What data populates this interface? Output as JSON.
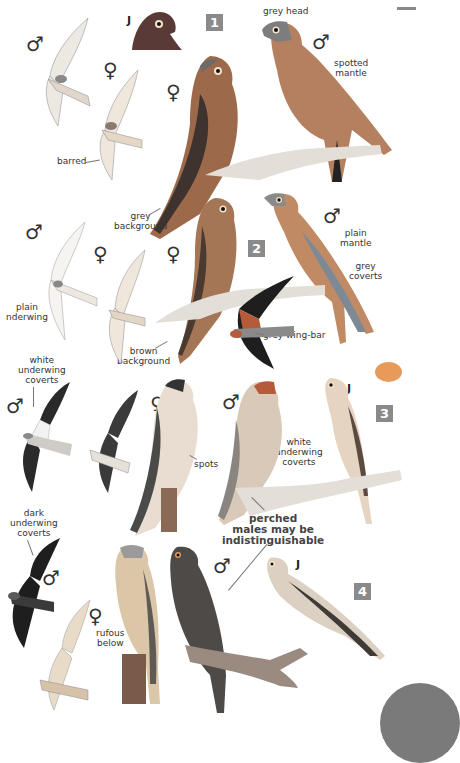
{
  "page": {
    "type": "field-guide-plate",
    "colors": {
      "badge": "#8a8a8a",
      "accent_blob": "#e89a5a",
      "corner_tab": "#7a7a7a"
    }
  },
  "sections": [
    {
      "number": "1",
      "labels": [
        "grey head",
        "spotted mantle",
        "barred",
        "grey background"
      ],
      "symbols": [
        "♂",
        "♀",
        "♀",
        "♂",
        "J"
      ]
    },
    {
      "number": "2",
      "labels": [
        "plain mantle",
        "grey coverts",
        "plain nderwing",
        "brown background",
        "grey wing-bar"
      ],
      "symbols": [
        "♂",
        "♀",
        "♀",
        "♂"
      ]
    },
    {
      "number": "3",
      "labels": [
        "white underwing coverts",
        "spots",
        "white underwing coverts",
        "perched males may be indistinguishable"
      ],
      "symbols": [
        "♂",
        "♀",
        "♂",
        "J"
      ]
    },
    {
      "number": "4",
      "labels": [
        "dark underwing coverts",
        "rufous below"
      ],
      "symbols": [
        "♂",
        "♀",
        "♂",
        "J"
      ]
    }
  ],
  "labels": {
    "grey_head": "grey head",
    "spotted": "spotted",
    "mantle": "mantle",
    "barred": "barred",
    "grey": "grey",
    "background": "background",
    "plain": "plain",
    "coverts": "coverts",
    "nderwing": "nderwing",
    "brown": "brown",
    "grey_wing_bar": "grey wing-bar",
    "white": "white",
    "underwing": "underwing",
    "spots": "spots",
    "perched": "perched",
    "males_may_be": "males may be",
    "indistinguishable": "indistinguishable",
    "dark": "dark",
    "rufous": "rufous",
    "below": "below"
  },
  "symbols": {
    "male": "♂",
    "female": "♀",
    "juvenile": "J"
  },
  "badges": [
    "1",
    "2",
    "3",
    "4"
  ]
}
